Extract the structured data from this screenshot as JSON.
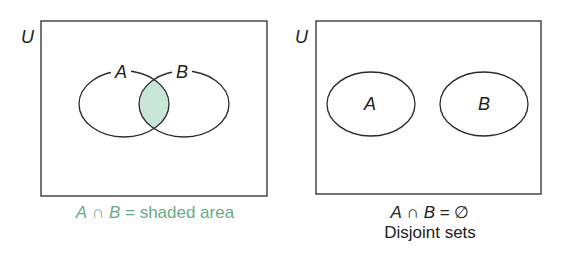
{
  "diagrams": [
    {
      "universe_label": "U",
      "set_a_label": "A",
      "set_b_label": "B",
      "caption": {
        "set_a": "A",
        "op": "∩",
        "set_b": "B",
        "eq": "=",
        "result": "shaded area"
      },
      "type": "overlapping"
    },
    {
      "universe_label": "U",
      "set_a_label": "A",
      "set_b_label": "B",
      "caption": {
        "set_a": "A",
        "op": "∩",
        "set_b": "B",
        "eq": "=",
        "result": "∅",
        "subtitle": "Disjoint sets"
      },
      "type": "disjoint"
    }
  ],
  "colors": {
    "shade": "#c8e6d8",
    "caption_green": "#6aaa86",
    "stroke": "#2a2a2a"
  }
}
